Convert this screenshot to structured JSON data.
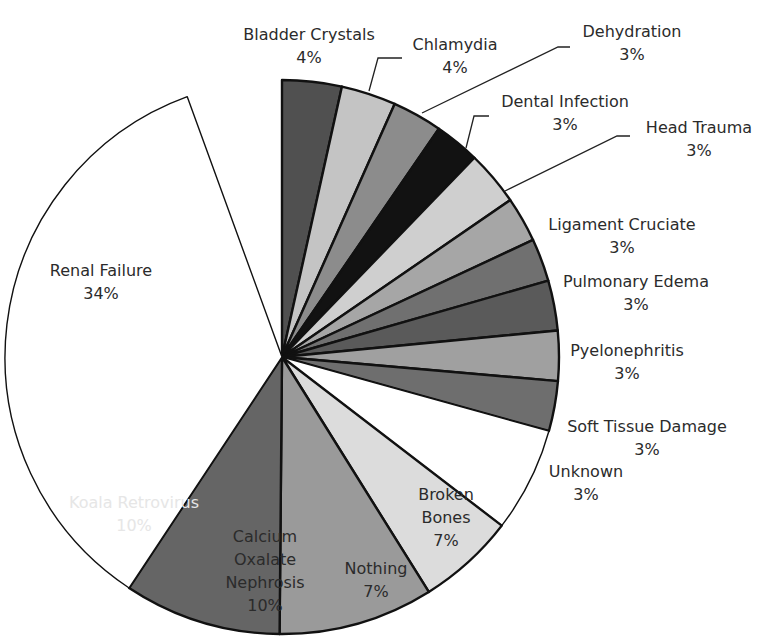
{
  "chart_data": {
    "type": "pie",
    "title": "",
    "start_angle_deg": 0,
    "direction": "clockwise",
    "center": [
      282,
      357
    ],
    "radius": 277,
    "slices": [
      {
        "label": "Bladder Crystals",
        "pct_label": "4%",
        "value": 4,
        "sweep": 12.5,
        "color": "#505050",
        "label_lines": [
          "Bladder Crystals",
          "4%"
        ],
        "label_pos": [
          309,
          40
        ],
        "text_color": "dark",
        "leader": null
      },
      {
        "label": "Chlamydia",
        "pct_label": "4%",
        "value": 4,
        "sweep": 11.5,
        "color": "#c4c4c4",
        "label_lines": [
          "Chlamydia",
          "4%"
        ],
        "label_pos": [
          455,
          50
        ],
        "text_color": "dark",
        "leader": [
          [
            369,
            91
          ],
          [
            378,
            58
          ],
          [
            402,
            58
          ]
        ]
      },
      {
        "label": "Dehydration",
        "pct_label": "3%",
        "value": 3,
        "sweep": 10.5,
        "color": "#8c8c8c",
        "label_lines": [
          "Dehydration",
          "3%"
        ],
        "label_pos": [
          632,
          37
        ],
        "text_color": "dark",
        "leader": [
          [
            422,
            113
          ],
          [
            558,
            47
          ],
          [
            570,
            47
          ]
        ]
      },
      {
        "label": "Dental Infection",
        "pct_label": "3%",
        "value": 3,
        "sweep": 9.5,
        "color": "#121212",
        "label_lines": [
          "Dental Infection",
          "3%"
        ],
        "label_pos": [
          565,
          107
        ],
        "text_color": "dark",
        "leader": [
          [
            466,
            148
          ],
          [
            474,
            116
          ],
          [
            489,
            116
          ]
        ]
      },
      {
        "label": "Head Trauma",
        "pct_label": "3%",
        "value": 3,
        "sweep": 11.5,
        "color": "#cfcfcf",
        "label_lines": [
          "Head Trauma",
          "3%"
        ],
        "label_pos": [
          699,
          133
        ],
        "text_color": "dark",
        "leader": [
          [
            505,
            191
          ],
          [
            617,
            136
          ],
          [
            630,
            136
          ]
        ]
      },
      {
        "label": "Ligament Cruciate",
        "pct_label": "3%",
        "value": 3,
        "sweep": 9.5,
        "color": "#a6a6a6",
        "label_lines": [
          "Ligament Cruciate",
          "3%"
        ],
        "label_pos": [
          622,
          230
        ],
        "text_color": "dark",
        "leader": null
      },
      {
        "label": "Pulmonary Edema",
        "pct_label": "3%",
        "value": 3,
        "sweep": 9.0,
        "color": "#707070",
        "label_lines": [
          "Pulmonary Edema",
          "3%"
        ],
        "label_pos": [
          636,
          287
        ],
        "text_color": "dark",
        "leader": null
      },
      {
        "label": "Pyelonephritis",
        "pct_label": "3%",
        "value": 3,
        "sweep": 10.5,
        "color": "#5a5a5a",
        "label_lines": [
          "Pyelonephritis",
          "3%"
        ],
        "label_pos": [
          627,
          356
        ],
        "text_color": "dark",
        "leader": null
      },
      {
        "label": "Soft Tissue Damage",
        "pct_label": "3%",
        "value": 3,
        "sweep": 10.5,
        "color": "#a0a0a0",
        "label_lines": [
          "Soft Tissue Damage",
          "3%"
        ],
        "label_pos": [
          647,
          432
        ],
        "text_color": "dark",
        "leader": null
      },
      {
        "label": "Unknown",
        "pct_label": "3%",
        "value": 3,
        "sweep": 10.5,
        "color": "#6e6e6e",
        "label_lines": [
          "Unknown",
          "3%"
        ],
        "label_pos": [
          586,
          477
        ],
        "text_color": "dark",
        "leader": null
      },
      {
        "label": "Broken Bones",
        "pct_label": "7%",
        "value": 7,
        "sweep": 22.0,
        "color": "#ffffff",
        "label_lines": [
          "Broken",
          "Bones",
          "7%"
        ],
        "label_pos": [
          446,
          500
        ],
        "text_color": "dark",
        "leader": null
      },
      {
        "label": "Nothing",
        "pct_label": "7%",
        "value": 7,
        "sweep": 20.5,
        "color": "#dcdcdc",
        "label_lines": [
          "Nothing",
          "7%"
        ],
        "label_pos": [
          376,
          574
        ],
        "text_color": "dark",
        "leader": null
      },
      {
        "label": "Calcium Oxalate Nephrosis",
        "pct_label": "10%",
        "value": 10,
        "sweep": 32.5,
        "color": "#9a9a9a",
        "label_lines": [
          "Calcium",
          "Oxalate",
          "Nephrosis",
          "10%"
        ],
        "label_pos": [
          265,
          542
        ],
        "text_color": "dark",
        "leader": null
      },
      {
        "label": "Koala Retrovirus",
        "pct_label": "10%",
        "value": 10,
        "sweep": 33.0,
        "color": "#656565",
        "label_lines": [
          "Koala Retrovirus",
          "10%"
        ],
        "label_pos": [
          134,
          508
        ],
        "text_color": "light",
        "leader": null
      },
      {
        "label": "Renal Failure",
        "pct_label": "34%",
        "value": 34,
        "sweep": 126.5,
        "color": "#ffffff",
        "label_lines": [
          "Renal Failure",
          "34%"
        ],
        "label_pos": [
          101,
          276
        ],
        "text_color": "dark",
        "leader": null
      }
    ],
    "legend": null,
    "outline_color": "#111111"
  }
}
